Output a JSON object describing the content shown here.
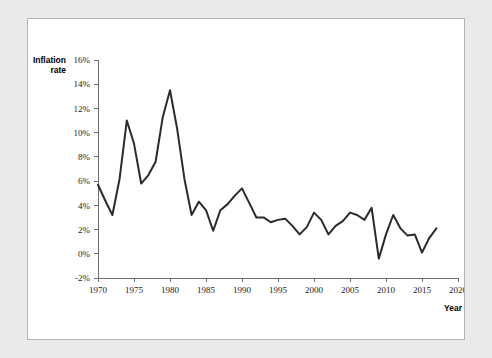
{
  "chart_data": {
    "type": "line",
    "title": "",
    "xlabel": "Year",
    "ylabel": "Inflation rate",
    "xlim": [
      1970,
      2020
    ],
    "ylim": [
      -2,
      16
    ],
    "grid": false,
    "legend": "none",
    "y_tick_labels": [
      "16%",
      "14%",
      "12%",
      "10%",
      "8%",
      "6%",
      "4%",
      "2%",
      "0%",
      "-2%"
    ],
    "y_tick_values": [
      16,
      14,
      12,
      10,
      8,
      6,
      4,
      2,
      0,
      -2
    ],
    "x_tick_labels": [
      "1970",
      "1975",
      "1980",
      "1985",
      "1990",
      "1995",
      "2000",
      "2005",
      "2010",
      "2015",
      "2020"
    ],
    "x_tick_values": [
      1970,
      1975,
      1980,
      1985,
      1990,
      1995,
      2000,
      2005,
      2010,
      2015,
      2020
    ],
    "series": [
      {
        "name": "Inflation rate",
        "color": "#2b2b2b",
        "x": [
          1970,
          1971,
          1972,
          1973,
          1974,
          1975,
          1976,
          1977,
          1978,
          1979,
          1980,
          1981,
          1982,
          1983,
          1984,
          1985,
          1986,
          1987,
          1988,
          1989,
          1990,
          1991,
          1992,
          1993,
          1994,
          1995,
          1996,
          1997,
          1998,
          1999,
          2000,
          2001,
          2002,
          2003,
          2004,
          2005,
          2006,
          2007,
          2008,
          2009,
          2010,
          2011,
          2012,
          2013,
          2014,
          2015,
          2016,
          2017
        ],
        "values": [
          5.7,
          4.4,
          3.2,
          6.2,
          11.0,
          9.1,
          5.8,
          6.5,
          7.6,
          11.3,
          13.5,
          10.3,
          6.2,
          3.2,
          4.3,
          3.6,
          1.9,
          3.6,
          4.1,
          4.8,
          5.4,
          4.2,
          3.0,
          3.0,
          2.6,
          2.8,
          2.9,
          2.3,
          1.6,
          2.2,
          3.4,
          2.8,
          1.6,
          2.3,
          2.7,
          3.4,
          3.2,
          2.8,
          3.8,
          -0.4,
          1.6,
          3.2,
          2.1,
          1.5,
          1.6,
          0.1,
          1.3,
          2.1
        ]
      }
    ]
  }
}
